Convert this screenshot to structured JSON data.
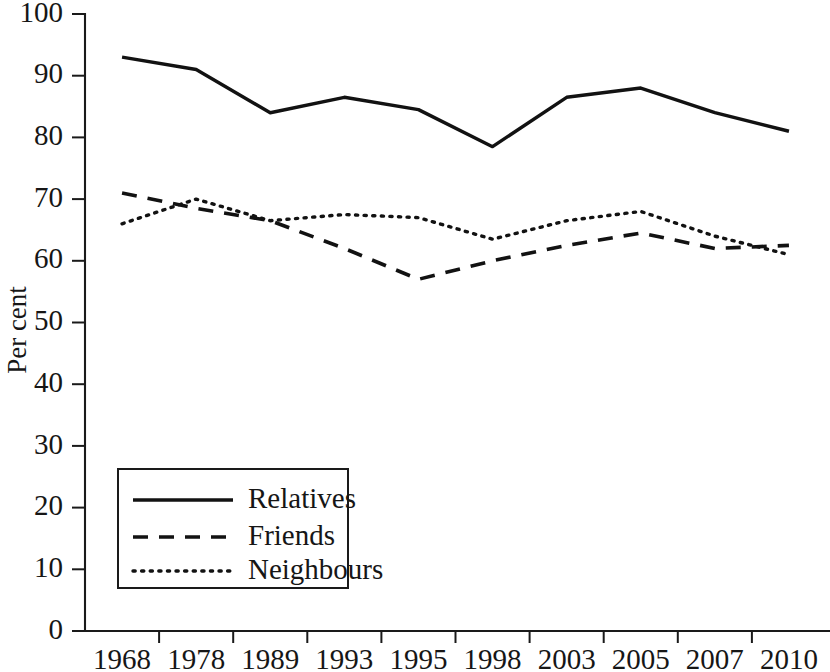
{
  "chart_data": {
    "type": "line",
    "title": "",
    "xlabel": "",
    "ylabel": "Per cent",
    "ylim": [
      0,
      100
    ],
    "ytick_step": 10,
    "grid": false,
    "legend_position": "inside-lower-left",
    "categories": [
      "1968",
      "1978",
      "1989",
      "1993",
      "1995",
      "1998",
      "2003",
      "2005",
      "2007",
      "2010"
    ],
    "yticks": [
      "0",
      "10",
      "20",
      "30",
      "40",
      "50",
      "60",
      "70",
      "80",
      "90",
      "100"
    ],
    "series": [
      {
        "name": "Relatives",
        "style": "solid",
        "color": "#121212",
        "values": [
          93,
          91,
          84,
          86.5,
          84.5,
          78.5,
          86.5,
          88,
          84,
          81
        ]
      },
      {
        "name": "Friends",
        "style": "dashed",
        "color": "#121212",
        "values": [
          71,
          68.5,
          66.5,
          62,
          57,
          60,
          62.5,
          64.5,
          62,
          62.5
        ]
      },
      {
        "name": "Neighbours",
        "style": "dotted",
        "color": "#121212",
        "values": [
          66,
          70,
          66.5,
          67.5,
          67,
          63.5,
          66.5,
          68,
          64,
          61
        ]
      }
    ]
  }
}
